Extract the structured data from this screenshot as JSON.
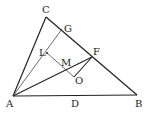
{
  "diagram": {
    "type": "geometry",
    "points": {
      "A": {
        "label": "A",
        "x": 13,
        "y": 96
      },
      "B": {
        "label": "B",
        "x": 137,
        "y": 95
      },
      "C": {
        "label": "C",
        "x": 46,
        "y": 17
      },
      "D": {
        "label": "D",
        "x": 75,
        "y": 96
      },
      "F": {
        "label": "F",
        "x": 92,
        "y": 57
      },
      "G": {
        "label": "G",
        "x": 62,
        "y": 29
      },
      "L": {
        "label": "L",
        "x": 47,
        "y": 53
      },
      "M": {
        "label": "M",
        "x": 65,
        "y": 69
      },
      "O": {
        "label": "O",
        "x": 74,
        "y": 77
      }
    },
    "segments": [
      [
        "A",
        "B"
      ],
      [
        "B",
        "C"
      ],
      [
        "C",
        "A"
      ],
      [
        "A",
        "F"
      ],
      [
        "A",
        "G"
      ],
      [
        "L",
        "O"
      ],
      [
        "O",
        "F"
      ]
    ]
  }
}
